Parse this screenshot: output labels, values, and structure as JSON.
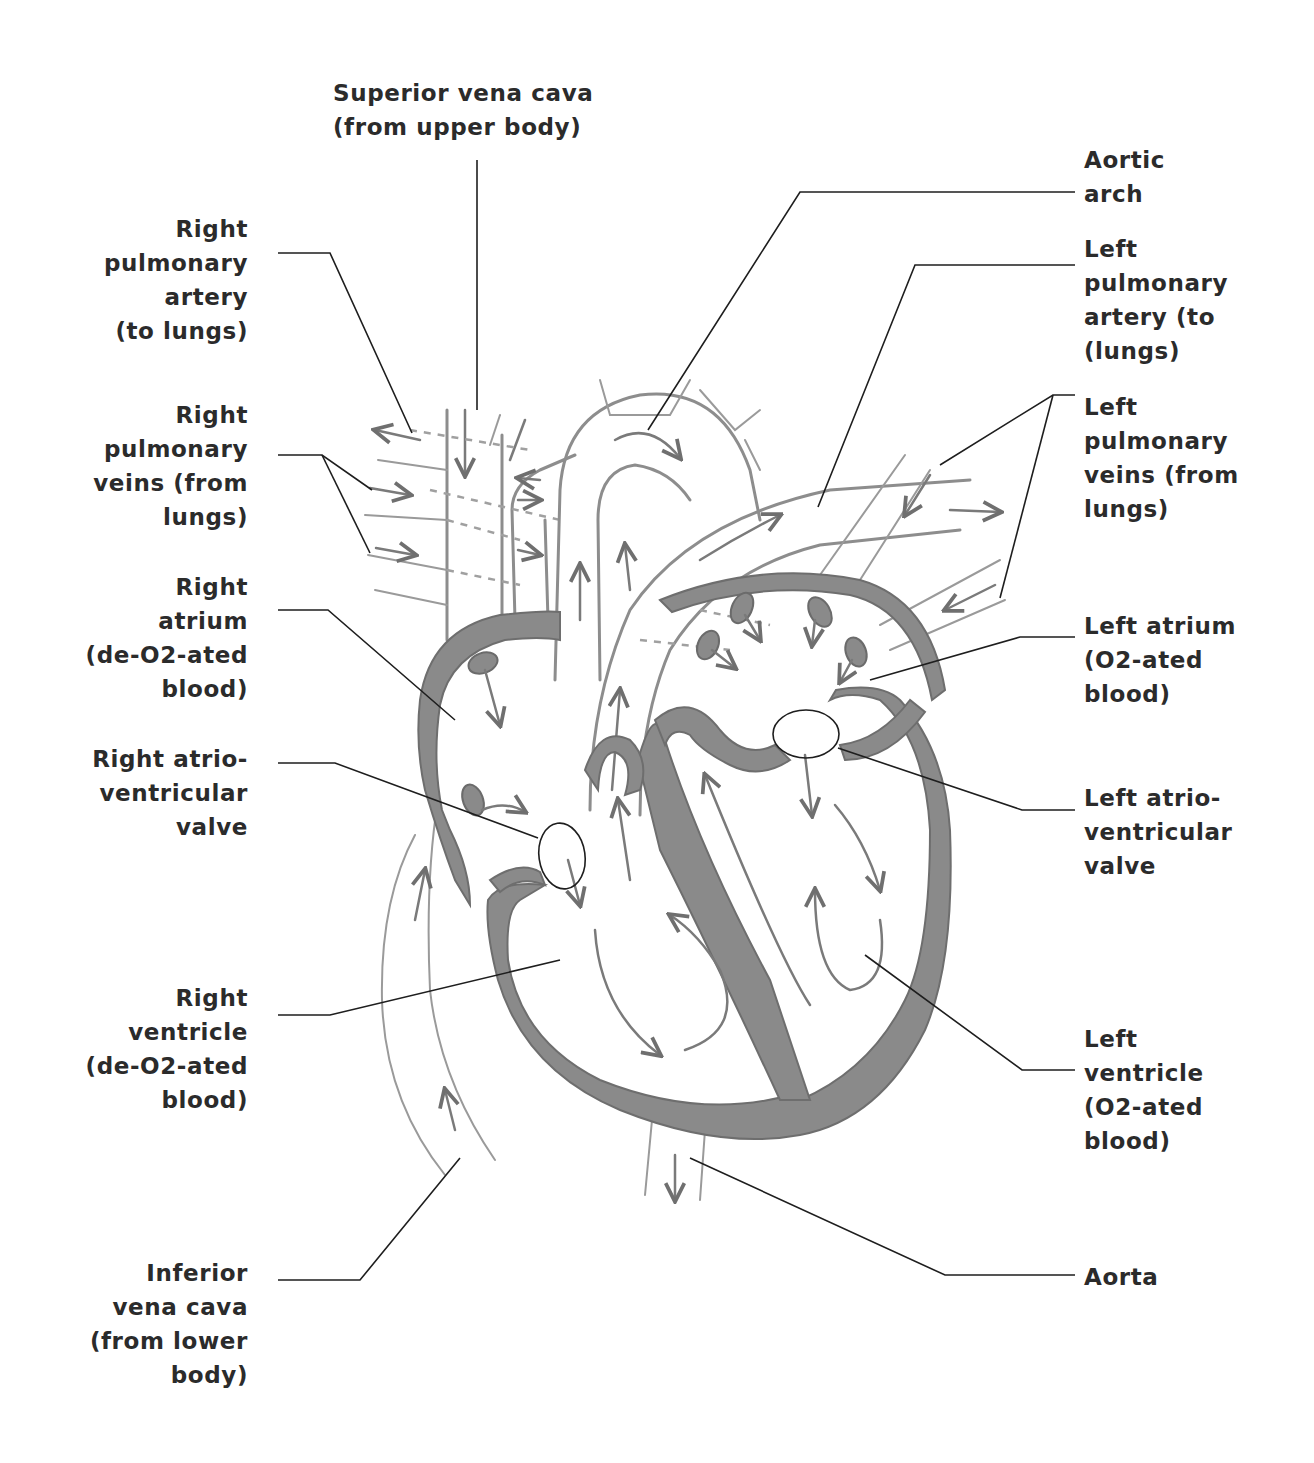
{
  "diagram": {
    "colors": {
      "background": "#ffffff",
      "label_text": "#2b2b2b",
      "tissue": "#8a8a8a",
      "vessel_outline": "#8d8d8d",
      "leader_line": "#1e1e1e"
    },
    "labels": {
      "superior_vena_cava": "Superior vena cava\n(from upper body)",
      "right_pulmonary_artery": "Right\npulmonary\nartery\n(to lungs)",
      "right_pulmonary_veins": "Right\npulmonary\nveins (from\nlungs)",
      "right_atrium": "Right\natrium\n(de-O2-ated\nblood)",
      "right_av_valve": "Right atrio-\nventricular\nvalve",
      "right_ventricle": "Right\nventricle\n(de-O2-ated\nblood)",
      "inferior_vena_cava": "Inferior\nvena cava\n(from lower\nbody)",
      "aortic_arch": "Aortic\narch",
      "left_pulmonary_artery": "Left\npulmonary\nartery (to\n(lungs)",
      "left_pulmonary_veins": "Left\npulmonary\nveins (from\nlungs)",
      "left_atrium": "Left atrium\n(O2-ated\nblood)",
      "left_av_valve": "Left atrio-\nventricular\nvalve",
      "left_ventricle": "Left\nventricle\n(O2-ated\nblood)",
      "aorta": "Aorta"
    },
    "icons": {
      "flow_arrow": "arrow-icon",
      "valve_marker": "ellipse-ring"
    }
  }
}
